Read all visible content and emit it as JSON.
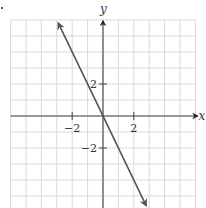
{
  "chart_data": {
    "type": "line",
    "title": "",
    "xlabel": "x",
    "ylabel": "y",
    "equation": "y = -2x",
    "series": [
      {
        "name": "line",
        "x": [
          -2.9,
          0,
          2.8
        ],
        "y": [
          5.8,
          0,
          -5.6
        ],
        "arrows_both_ends": true
      }
    ],
    "x_ticks": [
      {
        "value": -2,
        "label": "−2"
      },
      {
        "value": 2,
        "label": "2"
      }
    ],
    "y_ticks": [
      {
        "value": 2,
        "label": "2"
      },
      {
        "value": -2,
        "label": "−2"
      }
    ],
    "xlim": [
      -6.0,
      6.0
    ],
    "ylim": [
      -5.8,
      6.0
    ],
    "grid": true,
    "grid_step": 1,
    "legend": null
  },
  "style": {
    "grid_color": "#d9d9d9",
    "axis_color": "#444444",
    "line_color": "#555555"
  },
  "geometry": {
    "origin_px": [
      103,
      116
    ],
    "unit_x_px": 15.4,
    "unit_y_px": 16,
    "grid_left_px": 10.7,
    "grid_right_px": 195.5,
    "grid_top_px": 20,
    "grid_bottom_px": 208
  }
}
